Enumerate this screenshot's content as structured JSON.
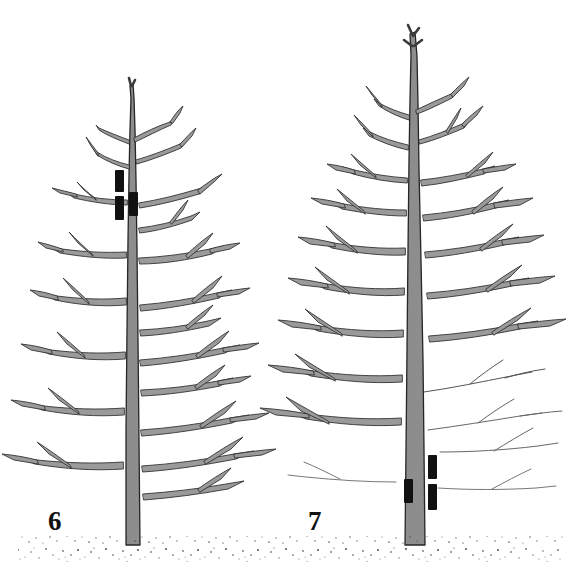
{
  "figure": {
    "background_color": "#ffffff",
    "width": 582,
    "height": 578,
    "panels": [
      {
        "id": "panel-6",
        "label": "6",
        "label_x": 48,
        "label_y": 508,
        "subject": "young-tree-with-three-pruning-marks-high-on-leader",
        "trunk_color": "#8c8c8c",
        "outline_color": "#2b2b2b",
        "trunk_base_x": 132,
        "trunk_top_y": 84,
        "ground_y": 545,
        "pruning_marks": [
          {
            "x": 115,
            "y": 170,
            "w": 9,
            "h": 22,
            "color": "#111111",
            "name": "pruning-mark-upper-left"
          },
          {
            "x": 115,
            "y": 196,
            "w": 9,
            "h": 24,
            "color": "#111111",
            "name": "pruning-mark-lower-left"
          },
          {
            "x": 129,
            "y": 192,
            "w": 9,
            "h": 24,
            "color": "#111111",
            "name": "pruning-mark-lower-right"
          }
        ]
      },
      {
        "id": "panel-7",
        "label": "7",
        "label_x": 308,
        "label_y": 508,
        "subject": "older-tree-with-three-pruning-marks-low-on-trunk",
        "trunk_color": "#8c8c8c",
        "outline_color": "#2b2b2b",
        "trunk_base_x": 414,
        "trunk_top_y": 30,
        "ground_y": 545,
        "pruning_marks": [
          {
            "x": 404,
            "y": 479,
            "w": 9,
            "h": 24,
            "color": "#111111",
            "name": "pruning-mark-left"
          },
          {
            "x": 428,
            "y": 455,
            "w": 9,
            "h": 24,
            "color": "#111111",
            "name": "pruning-mark-upper-right"
          },
          {
            "x": 428,
            "y": 484,
            "w": 9,
            "h": 26,
            "color": "#111111",
            "name": "pruning-mark-lower-right"
          }
        ]
      }
    ],
    "ground": {
      "name": "stippled-soil-line",
      "color": "#5a5a5a",
      "y": 545,
      "description": "speckled stipple soil surface spanning full width"
    },
    "palette": {
      "paper": "#ffffff",
      "branch_fill": "#9a9a9a",
      "branch_outline": "#262626",
      "trunk_fill": "#8a8a8a",
      "mark_black": "#111111",
      "label_ink": "#111111"
    }
  }
}
